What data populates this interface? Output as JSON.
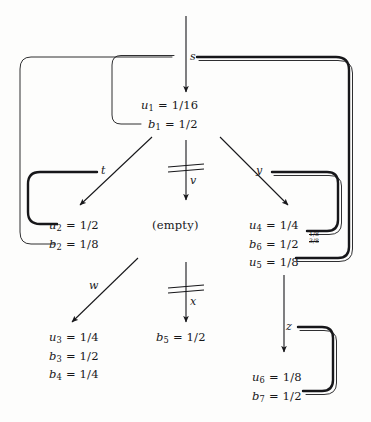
{
  "figure": {
    "type": "flow-diagram",
    "background_color": "#fdfdfc",
    "ink_color": "#17171a"
  },
  "nodes": [
    {
      "id": "root",
      "name": "node-root",
      "lines": [
        "u1 = 1/16",
        "b1 = 1/2"
      ],
      "line1_var": "u",
      "line1_sub": "1",
      "line1_val": "= 1/16",
      "line2_var": "b",
      "line2_sub": "1",
      "line2_val": "= 1/2"
    },
    {
      "id": "left",
      "name": "node-left",
      "line1_var": "u",
      "line1_sub": "2",
      "line1_val": "= 1/2",
      "line2_var": "b",
      "line2_sub": "2",
      "line2_val": "= 1/8"
    },
    {
      "id": "center",
      "name": "node-center-empty",
      "text": "(empty)"
    },
    {
      "id": "right",
      "name": "node-right",
      "line1_var": "u",
      "line1_sub": "4",
      "line1_val": "= 1/4",
      "line2_var": "b",
      "line2_sub": "6",
      "line2_val": "= 1/2",
      "line3_var": "u",
      "line3_sub": "5",
      "line3_val": "= 1/8"
    },
    {
      "id": "bottomleft",
      "name": "node-bottom-left",
      "line1_var": "u",
      "line1_sub": "3",
      "line1_val": "= 1/4",
      "line2_var": "b",
      "line2_sub": "3",
      "line2_val": "= 1/2",
      "line3_var": "b",
      "line3_sub": "4",
      "line3_val": "= 1/4"
    },
    {
      "id": "bottomcenter",
      "name": "node-bottom-center",
      "line1_var": "b",
      "line1_sub": "5",
      "line1_val": "= 1/2"
    },
    {
      "id": "bottomright",
      "name": "node-bottom-right",
      "line1_var": "u",
      "line1_sub": "6",
      "line1_val": "= 1/8",
      "line2_var": "b",
      "line2_sub": "7",
      "line2_val": "= 1/2"
    }
  ],
  "edges": [
    {
      "id": "s",
      "label": "s",
      "name": "edge-label-s",
      "cut": false
    },
    {
      "id": "t",
      "label": "t",
      "name": "edge-label-t",
      "cut": false
    },
    {
      "id": "v",
      "label": "v",
      "name": "edge-label-v",
      "cut": true
    },
    {
      "id": "y",
      "label": "y",
      "name": "edge-label-y",
      "cut": false
    },
    {
      "id": "w",
      "label": "w",
      "name": "edge-label-w",
      "cut": false
    },
    {
      "id": "x",
      "label": "x",
      "name": "edge-label-x",
      "cut": true
    },
    {
      "id": "z",
      "label": "z",
      "name": "edge-label-z",
      "cut": false
    }
  ],
  "annotations": [
    {
      "id": "fraction-pair",
      "name": "annotation-fraction-pair",
      "top": "1/8",
      "bottom": "3/8"
    }
  ]
}
